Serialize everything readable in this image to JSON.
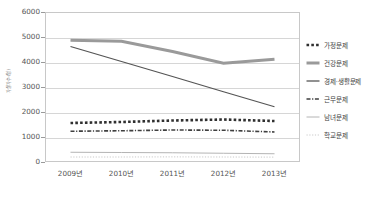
{
  "chart_data": {
    "type": "line",
    "title": "",
    "xlabel": "",
    "ylabel": "자살자수(명)",
    "categories": [
      "2009년",
      "2010년",
      "2011년",
      "2012년",
      "2013년"
    ],
    "ylim": [
      0,
      6000
    ],
    "ytick_values": [
      0,
      1000,
      2000,
      3000,
      4000,
      5000,
      6000
    ],
    "ytick_labels": [
      "0",
      "1000",
      "2000",
      "3000",
      "4000",
      "5000",
      "6000"
    ],
    "grid": true,
    "legend_position": "right",
    "series": [
      {
        "name": "가정문제",
        "values": [
          1560,
          1600,
          1660,
          1700,
          1640
        ],
        "color": "#2f2f2f",
        "style": "dotted-thick",
        "marker": "dotted-thick"
      },
      {
        "name": "건강문제",
        "values": [
          4870,
          4830,
          4420,
          3950,
          4110
        ],
        "color": "#9a9a9a",
        "style": "solid-thick",
        "marker": "solid-thick"
      },
      {
        "name": "경제·생활문제",
        "values": [
          4620,
          4020,
          3420,
          2810,
          2210
        ],
        "color": "#555555",
        "style": "solid",
        "marker": "solid"
      },
      {
        "name": "근무문제",
        "values": [
          1230,
          1250,
          1280,
          1270,
          1200
        ],
        "color": "#3f3f3f",
        "style": "dash-dot",
        "marker": "dash-dot"
      },
      {
        "name": "남녀문제",
        "values": [
          390,
          380,
          370,
          350,
          330
        ],
        "color": "#b4b4b4",
        "style": "solid-thin",
        "marker": "solid-thin"
      },
      {
        "name": "학교문제",
        "values": [
          200,
          200,
          205,
          200,
          195
        ],
        "color": "#c9c9c9",
        "style": "dotted-fine",
        "marker": "dotted-fine"
      }
    ]
  },
  "legend": {
    "items": [
      {
        "label": "가정문제"
      },
      {
        "label": "건강문제"
      },
      {
        "label": "경제·생활문제"
      },
      {
        "label": "근무문제"
      },
      {
        "label": "남녀문제"
      },
      {
        "label": "학교문제"
      }
    ]
  }
}
